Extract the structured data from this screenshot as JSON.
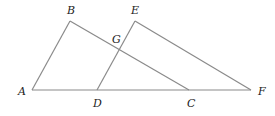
{
  "diagram": {
    "type": "geometry",
    "points": {
      "A": {
        "label": "A",
        "x": 32,
        "y": 90
      },
      "B": {
        "label": "B",
        "x": 70,
        "y": 21
      },
      "C": {
        "label": "C",
        "x": 189,
        "y": 90
      },
      "D": {
        "label": "D",
        "x": 97,
        "y": 90
      },
      "E": {
        "label": "E",
        "x": 135,
        "y": 21
      },
      "F": {
        "label": "F",
        "x": 251,
        "y": 90
      },
      "G": {
        "label": "G",
        "x": 119,
        "y": 50
      }
    },
    "segments": [
      "AF",
      "AB",
      "BC",
      "DE",
      "EF"
    ],
    "labels": {
      "A": "A",
      "B": "B",
      "C": "C",
      "D": "D",
      "E": "E",
      "F": "F",
      "G": "G"
    },
    "colors": {
      "line": "#8a8a8a",
      "text": "#222222"
    }
  }
}
